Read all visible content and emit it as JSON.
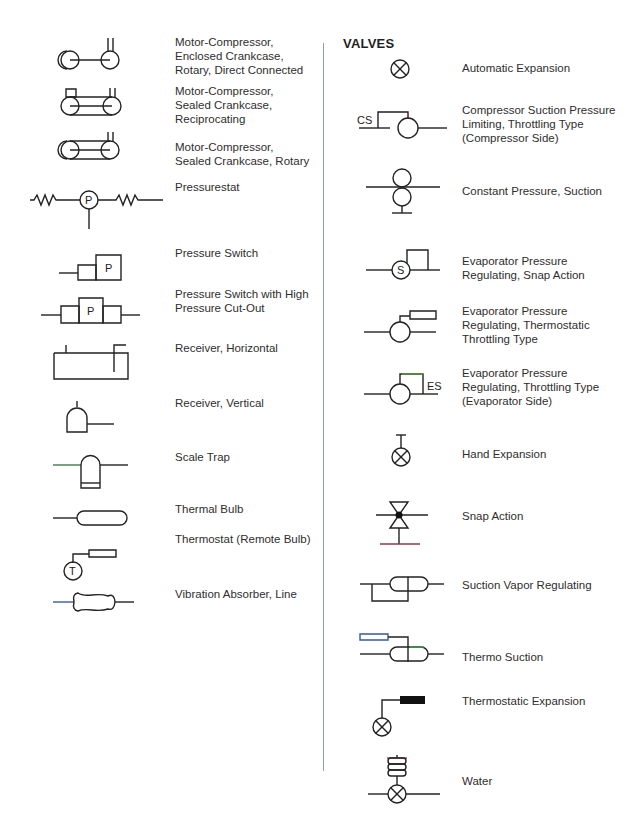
{
  "header": {
    "cropped_text": ""
  },
  "left_column": {
    "items": [
      {
        "label": "Motor-Compressor,\nEnclosed Crankcase,\nRotary, Direct Connected",
        "icon": "motor-compressor-enclosed-rotary-direct-icon"
      },
      {
        "label": "Motor-Compressor,\nSealed Crankcase,\nReciprocating",
        "icon": "motor-compressor-sealed-reciprocating-icon"
      },
      {
        "label": "Motor-Compressor,\nSealed Crankcase, Rotary",
        "icon": "motor-compressor-sealed-rotary-icon"
      },
      {
        "label": "Pressurestat",
        "icon": "pressurestat-icon",
        "symbol_letter": "P"
      },
      {
        "label": "Pressure Switch",
        "icon": "pressure-switch-icon",
        "symbol_letter": "P"
      },
      {
        "label": "Pressure Switch with High\nPressure Cut-Out",
        "icon": "pressure-switch-high-cutout-icon",
        "symbol_letter": "P"
      },
      {
        "label": "Receiver, Horizontal",
        "icon": "receiver-horizontal-icon"
      },
      {
        "label": "Receiver, Vertical",
        "icon": "receiver-vertical-icon"
      },
      {
        "label": "Scale Trap",
        "icon": "scale-trap-icon"
      },
      {
        "label": "Thermal Bulb",
        "icon": "thermal-bulb-icon"
      },
      {
        "label": "Thermostat (Remote Bulb)",
        "icon": "thermostat-remote-bulb-icon",
        "symbol_letter": "T"
      },
      {
        "label": "Vibration Absorber, Line",
        "icon": "vibration-absorber-icon"
      }
    ]
  },
  "right_column": {
    "title": "VALVES",
    "items": [
      {
        "label": "Automatic Expansion",
        "icon": "automatic-expansion-valve-icon"
      },
      {
        "label": "Compressor Suction Pressure\nLimiting, Throttling Type\n(Compressor Side)",
        "icon": "compressor-suction-pressure-valve-icon",
        "symbol_text": "CS"
      },
      {
        "label": "Constant Pressure, Suction",
        "icon": "constant-pressure-suction-valve-icon"
      },
      {
        "label": "Evaporator Pressure\nRegulating, Snap Action",
        "icon": "evaporator-pressure-snap-action-icon",
        "symbol_letter": "S"
      },
      {
        "label": "Evaporator Pressure\nRegulating, Thermostatic\nThrottling Type",
        "icon": "evaporator-pressure-thermostatic-icon"
      },
      {
        "label": "Evaporator Pressure\nRegulating, Throttling Type\n(Evaporator Side)",
        "icon": "evaporator-pressure-throttling-icon",
        "symbol_text": "ES"
      },
      {
        "label": "Hand Expansion",
        "icon": "hand-expansion-valve-icon"
      },
      {
        "label": "Snap Action",
        "icon": "snap-action-valve-icon"
      },
      {
        "label": "Suction Vapor Regulating",
        "icon": "suction-vapor-regulating-icon"
      },
      {
        "label": "Thermo Suction",
        "icon": "thermo-suction-valve-icon"
      },
      {
        "label": "Thermostatic Expansion",
        "icon": "thermostatic-expansion-valve-icon"
      },
      {
        "label": "Water",
        "icon": "water-valve-icon"
      }
    ]
  },
  "colors": {
    "divider": "#8f96c8",
    "stroke": "#222222",
    "text": "#2e2e2e"
  }
}
